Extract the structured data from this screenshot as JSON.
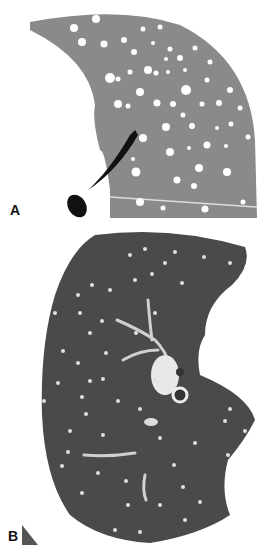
{
  "figure": {
    "panels": [
      {
        "label": "A",
        "description": "Schematic diagram of lung with randomly distributed nodules"
      },
      {
        "label": "B",
        "description": "CT image of lung showing random distribution of small nodules"
      }
    ],
    "colors": {
      "schematic_lung": "#8a8a8a",
      "nodule": "#ffffff",
      "ct_lung": "#4a4a4a",
      "background": "#ffffff",
      "airway": "#111111"
    }
  }
}
